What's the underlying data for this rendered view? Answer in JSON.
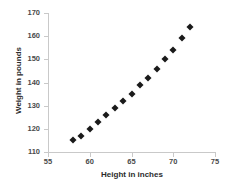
{
  "chart_data": {
    "type": "scatter",
    "title": "",
    "xlabel": "Height in inches",
    "ylabel": "Weight in pounds",
    "xlim": [
      55,
      75
    ],
    "ylim": [
      110,
      170
    ],
    "xticks": [
      55,
      60,
      65,
      70,
      75
    ],
    "yticks": [
      110,
      120,
      130,
      140,
      150,
      160,
      170
    ],
    "grid": false,
    "legend": null,
    "marker": "diamond",
    "marker_color": "#1a1a1a",
    "axis_color": "#c9c9c9",
    "x": [
      58,
      59,
      60,
      61,
      62,
      63,
      64,
      65,
      66,
      67,
      68,
      69,
      70,
      71,
      72
    ],
    "y": [
      115,
      117,
      120,
      123,
      126,
      129,
      132,
      135,
      139,
      142,
      146,
      150,
      154,
      159,
      164
    ],
    "points": [
      {
        "x": 58,
        "y": 115
      },
      {
        "x": 59,
        "y": 117
      },
      {
        "x": 60,
        "y": 120
      },
      {
        "x": 61,
        "y": 123
      },
      {
        "x": 62,
        "y": 126
      },
      {
        "x": 63,
        "y": 129
      },
      {
        "x": 64,
        "y": 132
      },
      {
        "x": 65,
        "y": 135
      },
      {
        "x": 66,
        "y": 139
      },
      {
        "x": 67,
        "y": 142
      },
      {
        "x": 68,
        "y": 146
      },
      {
        "x": 69,
        "y": 150
      },
      {
        "x": 70,
        "y": 154
      },
      {
        "x": 71,
        "y": 159
      },
      {
        "x": 72,
        "y": 164
      }
    ]
  }
}
